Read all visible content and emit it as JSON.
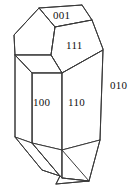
{
  "figure": {
    "name": "crystal-habit-diagram",
    "stroke_color": "#3a3a3a",
    "face_fill_color": "#ffffff",
    "background_color": "#ffffff",
    "width": 133,
    "height": 191
  },
  "labels": {
    "top_face": "001",
    "upper_right_face": "111",
    "left_prism_face": "100",
    "right_prism_face": "110",
    "outer_right_face": "010"
  }
}
